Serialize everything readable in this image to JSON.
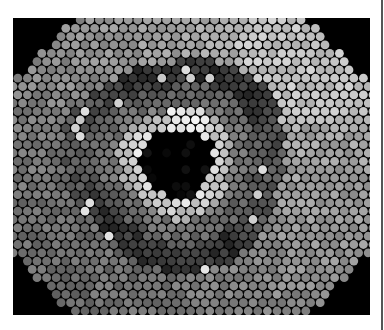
{
  "image": {
    "description": "Grayscale micrograph of a hexagonally packed fiber bundle showing a dark central core, a bright ring, and an irregular dark outer ring",
    "frame": {
      "x": 13,
      "y": 18,
      "width": 357,
      "height": 297
    },
    "background": "#000000",
    "cell_diameter_px": 9.6,
    "core": {
      "cx": 164,
      "cy": 145,
      "radius": 36
    },
    "bright_ring": {
      "inner": 36,
      "outer": 56
    },
    "dark_ring": {
      "inner": 82,
      "outer": 108
    },
    "octagon_clip": true
  },
  "divider": {
    "x": 381,
    "color": "#555555"
  }
}
